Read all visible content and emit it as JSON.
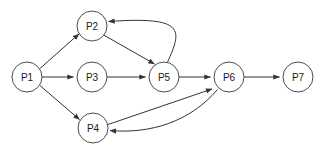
{
  "diagram": {
    "type": "directed-graph",
    "canvas": {
      "width": 328,
      "height": 154,
      "background": "#ffffff"
    },
    "style": {
      "node_fill": "#ffffff",
      "node_stroke": "#4d4d4d",
      "edge_stroke": "#333333",
      "label_color": "#1a1a1a",
      "node_radius": 15
    },
    "nodes": [
      {
        "id": "P1",
        "label": "P1",
        "cx": 27,
        "cy": 77,
        "r": 15
      },
      {
        "id": "P2",
        "label": "P2",
        "cx": 92,
        "cy": 26,
        "r": 15
      },
      {
        "id": "P3",
        "label": "P3",
        "cx": 92,
        "cy": 77,
        "r": 15
      },
      {
        "id": "P4",
        "label": "P4",
        "cx": 93,
        "cy": 128,
        "r": 15
      },
      {
        "id": "P5",
        "label": "P5",
        "cx": 164,
        "cy": 77,
        "r": 15
      },
      {
        "id": "P6",
        "label": "P6",
        "cx": 229,
        "cy": 77,
        "r": 15
      },
      {
        "id": "P7",
        "label": "P7",
        "cx": 298,
        "cy": 77,
        "r": 15
      }
    ],
    "edges": [
      {
        "from": "P1",
        "to": "P2",
        "shape": "straight",
        "d": "M 39.6 68.8 L 79.0 33.9"
      },
      {
        "from": "P1",
        "to": "P3",
        "shape": "straight",
        "d": "M 42.0 77 L 73.5 77"
      },
      {
        "from": "P1",
        "to": "P4",
        "shape": "straight",
        "d": "M 39.7 85.3 L 79.5 119.5"
      },
      {
        "from": "P3",
        "to": "P5",
        "shape": "straight",
        "d": "M 107.0 77 L 145.5 77"
      },
      {
        "from": "P2",
        "to": "P5",
        "shape": "straight",
        "d": "M 104.0 35.2 L 154.5 64.0"
      },
      {
        "from": "P5",
        "to": "P2",
        "shape": "curved",
        "d": "M 167.5 62.2 C 182 30 186 16 108.5 21.5"
      },
      {
        "from": "P5",
        "to": "P6",
        "shape": "straight",
        "d": "M 179.0 77 L 210.5 77"
      },
      {
        "from": "P4",
        "to": "P6",
        "shape": "straight",
        "d": "M 108.0 124.5 L 212.0 89.0"
      },
      {
        "from": "P6",
        "to": "P4",
        "shape": "curved",
        "d": "M 217.5 89.5 C 190 122 150 134 110.0 130.5"
      },
      {
        "from": "P6",
        "to": "P7",
        "shape": "straight",
        "d": "M 244.0 77 L 279.5 77"
      }
    ]
  }
}
